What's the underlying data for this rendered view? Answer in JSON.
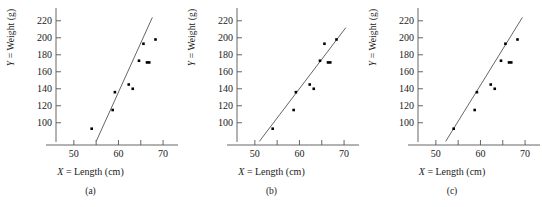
{
  "figure": {
    "panel_count": 3,
    "axis_color": "#555555",
    "point_color": "#000000",
    "line_color": "#666666",
    "background": "#ffffff"
  },
  "chart_data": [
    {
      "type": "scatter",
      "title": "",
      "caption": "(a)",
      "xlabel": "X = Length (cm)",
      "ylabel": "Y = Weight (g)",
      "xlabel_italic_prefix": "X",
      "xlabel_rest": " = Length (cm)",
      "ylabel_italic_prefix": "Y",
      "ylabel_rest": " = Weight (g)",
      "xlim": [
        46,
        72
      ],
      "ylim": [
        75,
        228
      ],
      "xticks": [
        50,
        55,
        60,
        65,
        70
      ],
      "xticklabels": [
        "50",
        "",
        "60",
        "",
        "70"
      ],
      "yticks": [
        100,
        120,
        140,
        160,
        180,
        200,
        220
      ],
      "yticklabels": [
        "100",
        "120",
        "140",
        "160",
        "180",
        "200",
        "220"
      ],
      "grid": false,
      "legend": "none",
      "x": [
        54.0,
        58.7,
        59.2,
        62.3,
        63.2,
        64.6,
        65.6,
        66.4,
        66.9,
        68.3
      ],
      "y": [
        93,
        115,
        136,
        145,
        140,
        173,
        193,
        171,
        171,
        198
      ],
      "fit_line": {
        "x0": 55.0,
        "y0": 78,
        "x1": 67.6,
        "y1": 224,
        "label": "steep-fit-line"
      }
    },
    {
      "type": "scatter",
      "title": "",
      "caption": "(b)",
      "xlabel": "X = Length (cm)",
      "ylabel": "Y = Weight (g)",
      "xlabel_italic_prefix": "X",
      "xlabel_rest": " = Length (cm)",
      "ylabel_italic_prefix": "Y",
      "ylabel_rest": " = Weight (g)",
      "xlim": [
        46,
        72
      ],
      "ylim": [
        75,
        228
      ],
      "xticks": [
        50,
        55,
        60,
        65,
        70
      ],
      "xticklabels": [
        "50",
        "",
        "60",
        "",
        "70"
      ],
      "yticks": [
        100,
        120,
        140,
        160,
        180,
        200,
        220
      ],
      "yticklabels": [
        "100",
        "120",
        "140",
        "160",
        "180",
        "200",
        "220"
      ],
      "grid": false,
      "legend": "none",
      "x": [
        54.0,
        58.7,
        59.2,
        62.3,
        63.2,
        64.6,
        65.6,
        66.4,
        66.9,
        68.3
      ],
      "y": [
        93,
        115,
        136,
        145,
        140,
        173,
        193,
        171,
        171,
        198
      ],
      "fit_line": {
        "x0": 51.0,
        "y0": 78,
        "x1": 70.4,
        "y1": 212,
        "label": "shallow-fit-line"
      }
    },
    {
      "type": "scatter",
      "title": "",
      "caption": "(c)",
      "xlabel": "X = Length (cm)",
      "ylabel": "Y = Weight (g)",
      "xlabel_italic_prefix": "X",
      "xlabel_rest": " = Length (cm)",
      "ylabel_italic_prefix": "Y",
      "ylabel_rest": " = Weight (g)",
      "xlim": [
        46,
        72
      ],
      "ylim": [
        75,
        228
      ],
      "xticks": [
        50,
        55,
        60,
        65,
        70
      ],
      "xticklabels": [
        "50",
        "",
        "60",
        "",
        "70"
      ],
      "yticks": [
        100,
        120,
        140,
        160,
        180,
        200,
        220
      ],
      "yticklabels": [
        "100",
        "120",
        "140",
        "160",
        "180",
        "200",
        "220"
      ],
      "grid": false,
      "legend": "none",
      "x": [
        54.0,
        58.7,
        59.2,
        62.3,
        63.2,
        64.6,
        65.6,
        66.4,
        66.9,
        68.3
      ],
      "y": [
        93,
        115,
        136,
        145,
        140,
        173,
        193,
        171,
        171,
        198
      ],
      "fit_line": {
        "x0": 52.2,
        "y0": 78,
        "x1": 69.4,
        "y1": 224,
        "label": "medium-fit-line"
      }
    }
  ]
}
